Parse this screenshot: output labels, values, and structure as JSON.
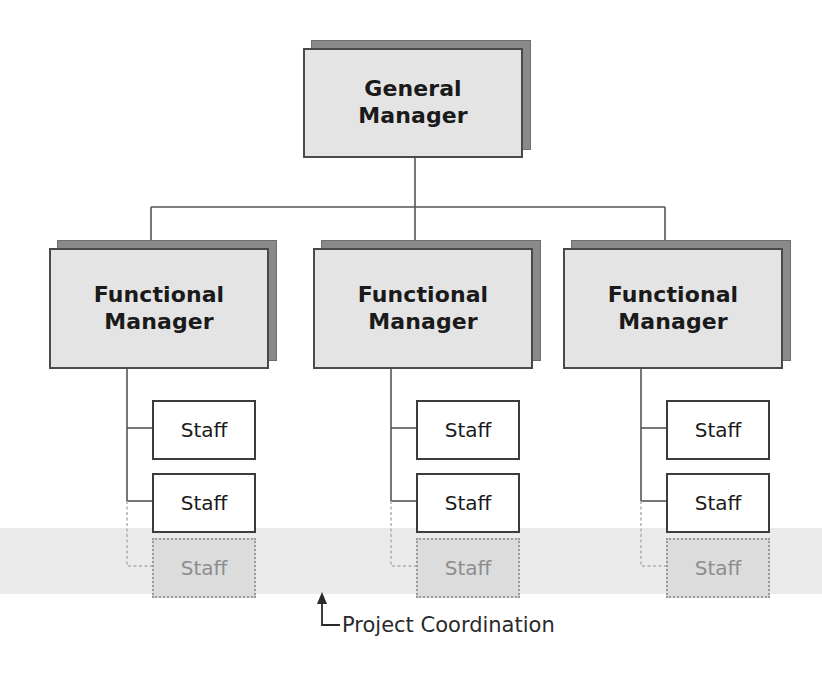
{
  "diagram": {
    "band_label": "project-coordination-band",
    "colors": {
      "box_fill": "#e4e4e4",
      "box_shadow": "#8a8a8a",
      "box_border": "#4a4a4a",
      "staff_fill": "#ffffff",
      "staff_border": "#3c3c3c",
      "dim_fill": "#dcdcdc",
      "dim_border": "#9a9a9a",
      "dim_text": "#8d8d8d",
      "band_fill": "#ebebeb",
      "line": "#55555a",
      "dim_line": "#b0b0b0",
      "text": "#1a1a1a"
    },
    "top": {
      "label": "General\nManager"
    },
    "columns": [
      {
        "manager": "Functional\nManager",
        "staff": [
          {
            "label": "Staff",
            "dimmed": false
          },
          {
            "label": "Staff",
            "dimmed": false
          },
          {
            "label": "Staff",
            "dimmed": true
          }
        ]
      },
      {
        "manager": "Functional\nManager",
        "staff": [
          {
            "label": "Staff",
            "dimmed": false
          },
          {
            "label": "Staff",
            "dimmed": false
          },
          {
            "label": "Staff",
            "dimmed": true
          }
        ]
      },
      {
        "manager": "Functional\nManager",
        "staff": [
          {
            "label": "Staff",
            "dimmed": false
          },
          {
            "label": "Staff",
            "dimmed": false
          },
          {
            "label": "Staff",
            "dimmed": true
          }
        ]
      }
    ],
    "callout": {
      "label": "Project Coordination",
      "arrow": "up-arrow-icon"
    }
  }
}
